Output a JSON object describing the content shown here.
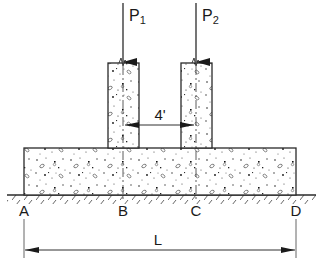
{
  "diagram": {
    "type": "combined-footing-section",
    "loads": [
      {
        "symbol": "P",
        "subscript": "1",
        "x": 123
      },
      {
        "symbol": "P",
        "subscript": "2",
        "x": 196
      }
    ],
    "columns": [
      {
        "name": "column-1",
        "x": 108,
        "width": 31,
        "top": 63
      },
      {
        "name": "column-2",
        "x": 181,
        "width": 31,
        "top": 63
      }
    ],
    "footing": {
      "x": 24,
      "y": 148,
      "width": 272,
      "height": 47
    },
    "ground_y": 195,
    "points": [
      {
        "label": "A",
        "x": 24
      },
      {
        "label": "B",
        "x": 123
      },
      {
        "label": "C",
        "x": 196
      },
      {
        "label": "D",
        "x": 296
      }
    ],
    "dimensions": {
      "column_spacing": "4'",
      "overall_length": "L"
    },
    "colors": {
      "line": "#2a2a2a",
      "hatch": "#555555",
      "aggregate": "#222222"
    }
  }
}
